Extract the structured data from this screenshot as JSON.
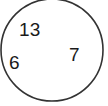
{
  "diagram": {
    "type": "venn-single-set",
    "background_color": "#ffffff",
    "shape": {
      "name": "set-circle",
      "kind": "circle",
      "center_x": 52,
      "center_y": 50,
      "radius": 51,
      "stroke_color": "#333333",
      "fill_color": "#ffffff",
      "stroke_width": 1.6,
      "clipped_edge": "top"
    },
    "labels": [
      {
        "id": "a",
        "text": "13",
        "x": 19,
        "y": 20,
        "color": "#1a1a1a",
        "font_size": 19
      },
      {
        "id": "b",
        "text": "6",
        "x": 9,
        "y": 53,
        "color": "#1a1a1a",
        "font_size": 19
      },
      {
        "id": "c",
        "text": "7",
        "x": 69,
        "y": 45,
        "color": "#1a1a1a",
        "font_size": 19
      }
    ]
  },
  "chart_data": {
    "type": "pie",
    "title": "",
    "subtitle": "",
    "xlabel": "",
    "ylabel": "",
    "categories": [
      "13",
      "6",
      "7"
    ],
    "values": [
      13,
      6,
      7
    ],
    "annotations": [
      "13",
      "6",
      "7"
    ],
    "legend": [],
    "grid": false
  }
}
